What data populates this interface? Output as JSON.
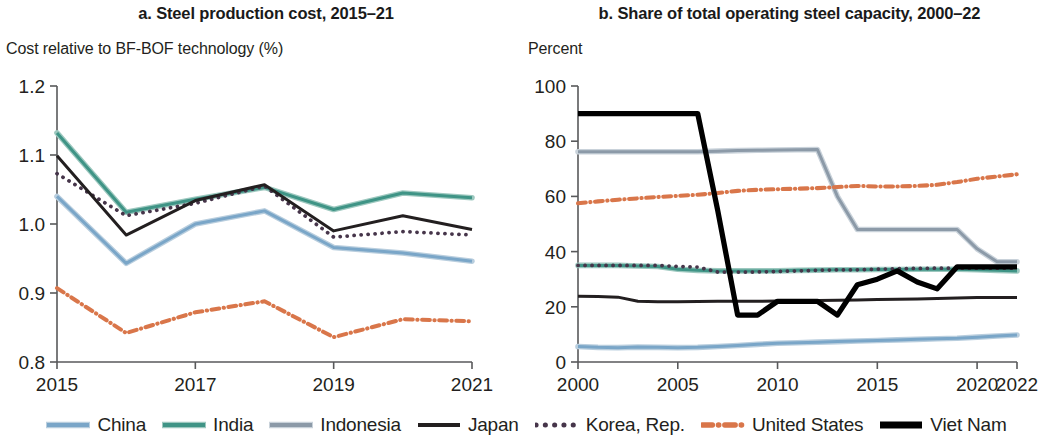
{
  "figure": {
    "panel_a": {
      "title": "a. Steel production cost, 2015–21",
      "axis_unit": "Cost relative to BF-BOF technology (%)"
    },
    "panel_b": {
      "title": "b. Share of total operating steel capacity, 2000–22",
      "axis_unit": "Percent"
    }
  },
  "legend": {
    "items": [
      {
        "label": "China",
        "color": "#7aa6c8",
        "style": "solid"
      },
      {
        "label": "India",
        "color": "#3f9486",
        "style": "solid"
      },
      {
        "label": "Indonesia",
        "color": "#8c9aa8",
        "style": "solid"
      },
      {
        "label": "Japan",
        "color": "#231f20",
        "style": "solid"
      },
      {
        "label": "Korea, Rep.",
        "color": "#46354a",
        "style": "dotted"
      },
      {
        "label": "United States",
        "color": "#d9764a",
        "style": "dashdot"
      },
      {
        "label": "Viet Nam",
        "color": "#000000",
        "style": "solid-thick"
      }
    ]
  },
  "chart_data": [
    {
      "id": "panel_a",
      "type": "line",
      "title": "a. Steel production cost, 2015–21",
      "xlabel": "",
      "ylabel": "Cost relative to BF-BOF technology (%)",
      "x": [
        2015,
        2016,
        2017,
        2018,
        2019,
        2020,
        2021
      ],
      "xlim": [
        2015,
        2021
      ],
      "ylim": [
        0.8,
        1.2
      ],
      "yticks": [
        0.8,
        0.9,
        1.0,
        1.1,
        1.2
      ],
      "ytick_labels": [
        "0.8",
        "0.9",
        "1.0",
        "1.1",
        "1.2"
      ],
      "xticks": [
        2015,
        2017,
        2019,
        2021
      ],
      "xtick_labels": [
        "2015",
        "2017",
        "2019",
        "2021"
      ],
      "grid": false,
      "legend_position": "bottom",
      "series": [
        {
          "name": "China",
          "color": "#7aa6c8",
          "style": "solid",
          "values": [
            1.04,
            0.943,
            1.0,
            1.019,
            0.966,
            0.958,
            0.946
          ]
        },
        {
          "name": "India",
          "color": "#3f9486",
          "style": "solid",
          "values": [
            1.132,
            1.017,
            1.036,
            1.053,
            1.021,
            1.045,
            1.038
          ]
        },
        {
          "name": "Japan",
          "color": "#231f20",
          "style": "solid",
          "values": [
            1.099,
            0.984,
            1.034,
            1.057,
            0.99,
            1.012,
            0.992
          ]
        },
        {
          "name": "Korea, Rep.",
          "color": "#46354a",
          "style": "dotted",
          "values": [
            1.073,
            1.012,
            1.03,
            1.055,
            0.981,
            0.989,
            0.984
          ]
        },
        {
          "name": "United States",
          "color": "#d9764a",
          "style": "dashdot",
          "values": [
            0.907,
            0.842,
            0.872,
            0.888,
            0.836,
            0.862,
            0.859
          ]
        }
      ]
    },
    {
      "id": "panel_b",
      "type": "line",
      "title": "b. Share of total operating steel capacity, 2000–22",
      "xlabel": "",
      "ylabel": "Percent",
      "x": [
        2000,
        2001,
        2002,
        2003,
        2004,
        2005,
        2006,
        2007,
        2008,
        2009,
        2010,
        2011,
        2012,
        2013,
        2014,
        2015,
        2016,
        2017,
        2018,
        2019,
        2020,
        2021,
        2022
      ],
      "xlim": [
        2000,
        2022
      ],
      "ylim": [
        0,
        100
      ],
      "yticks": [
        0,
        20,
        40,
        60,
        80,
        100
      ],
      "ytick_labels": [
        "0",
        "20",
        "40",
        "60",
        "80",
        "100"
      ],
      "xticks": [
        2000,
        2005,
        2010,
        2015,
        2020,
        2022
      ],
      "xtick_labels": [
        "2000",
        "2005",
        "2010",
        "2015",
        "2020",
        "2022"
      ],
      "grid": false,
      "legend_position": "bottom",
      "series": [
        {
          "name": "China",
          "color": "#7aa6c8",
          "style": "solid",
          "values": [
            5.6,
            5.3,
            5.2,
            5.4,
            5.3,
            5.2,
            5.3,
            5.6,
            6.0,
            6.4,
            6.8,
            7.0,
            7.2,
            7.4,
            7.6,
            7.8,
            8.0,
            8.2,
            8.4,
            8.6,
            9.0,
            9.4,
            9.8
          ]
        },
        {
          "name": "India",
          "color": "#3f9486",
          "style": "solid",
          "values": [
            35.0,
            35.0,
            35.0,
            34.8,
            34.6,
            33.6,
            33.2,
            33.0,
            33.0,
            33.0,
            33.0,
            33.2,
            33.3,
            33.4,
            33.4,
            33.5,
            33.5,
            33.6,
            33.6,
            33.6,
            33.4,
            33.2,
            33.0
          ]
        },
        {
          "name": "Indonesia",
          "color": "#8c9aa8",
          "style": "solid",
          "values": [
            76.2,
            76.2,
            76.2,
            76.2,
            76.2,
            76.2,
            76.2,
            76.4,
            76.6,
            76.7,
            76.8,
            76.9,
            77.0,
            60.0,
            48.0,
            48.0,
            48.0,
            48.0,
            48.0,
            48.0,
            41.0,
            36.3,
            36.3
          ]
        },
        {
          "name": "Japan",
          "color": "#231f20",
          "style": "solid",
          "values": [
            23.8,
            23.7,
            23.5,
            22.0,
            21.8,
            21.8,
            21.9,
            22.0,
            22.0,
            22.0,
            22.1,
            22.2,
            22.3,
            22.4,
            22.5,
            22.6,
            22.7,
            22.8,
            23.0,
            23.2,
            23.4,
            23.4,
            23.4
          ]
        },
        {
          "name": "Korea, Rep.",
          "color": "#46354a",
          "style": "dotted",
          "values": [
            35.0,
            35.0,
            35.0,
            35.0,
            35.0,
            34.6,
            34.4,
            32.6,
            32.6,
            32.6,
            32.8,
            33.0,
            33.2,
            33.4,
            33.4,
            33.6,
            33.8,
            33.9,
            34.0,
            34.0,
            34.0,
            34.0,
            34.0
          ]
        },
        {
          "name": "United States",
          "color": "#d9764a",
          "style": "dashdot",
          "values": [
            57.5,
            58.2,
            58.8,
            59.3,
            59.8,
            60.2,
            60.6,
            61.2,
            62.0,
            62.4,
            62.6,
            62.8,
            63.0,
            63.4,
            63.8,
            63.6,
            63.6,
            63.8,
            64.2,
            65.2,
            66.4,
            67.2,
            68.0
          ]
        },
        {
          "name": "Viet Nam",
          "color": "#000000",
          "style": "solid-thick",
          "values": [
            90.0,
            90.0,
            90.0,
            90.0,
            90.0,
            90.0,
            90.0,
            55.0,
            17.0,
            17.0,
            22.0,
            22.0,
            22.0,
            17.0,
            28.0,
            30.0,
            33.0,
            29.0,
            26.5,
            34.5,
            34.5,
            34.5,
            34.5
          ]
        }
      ]
    }
  ]
}
